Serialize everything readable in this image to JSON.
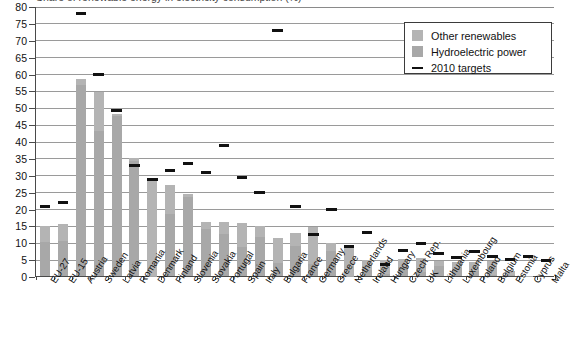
{
  "chart_data": {
    "type": "bar",
    "title": "Share of renewable energy in electricity consumption (%)",
    "xlabel": "",
    "ylabel": "",
    "ylim": [
      0,
      80
    ],
    "ytick_step": 5,
    "yticks": [
      "80",
      "75",
      "70",
      "65",
      "60",
      "55",
      "50",
      "45",
      "40",
      "35",
      "30",
      "25",
      "20",
      "15",
      "10",
      "5",
      "0"
    ],
    "grid": true,
    "legend_position": "top-right",
    "legend": [
      {
        "label": "Other renewables",
        "type": "swatch",
        "color": "#b4b4b4"
      },
      {
        "label": "Hydroelectric power",
        "type": "swatch",
        "color": "#a8a8a8"
      },
      {
        "label": "2010 targets",
        "type": "line",
        "color": "#111111"
      }
    ],
    "categories": [
      "EU-27",
      "EU-15",
      "Austria",
      "Sweden",
      "Latvia",
      "Romania",
      "Denmark",
      "Finland",
      "Slovenia",
      "Slovakia",
      "Portugal",
      "Spain",
      "Italy",
      "Bulgaria",
      "France",
      "Germany",
      "Greece",
      "Netherlands",
      "Ireland",
      "Hungary",
      "Czech Rep.",
      "UK",
      "Lithuania",
      "Luxembourg",
      "Poland",
      "Belgium",
      "Estonia",
      "Cyprus",
      "Malta"
    ],
    "series": [
      {
        "name": "Hydroelectric power",
        "values": [
          10.0,
          10.5,
          56.5,
          43.0,
          47.5,
          34.0,
          0.1,
          18.5,
          23.5,
          14.0,
          12.5,
          8.5,
          11.5,
          4.0,
          9.0,
          3.5,
          7.5,
          0.1,
          1.8,
          0.6,
          2.8,
          1.2,
          3.0,
          2.5,
          1.4,
          0.4,
          0.3,
          0.0,
          0.0
        ]
      },
      {
        "name": "Other renewables",
        "values": [
          4.9,
          4.8,
          1.8,
          11.5,
          0.6,
          0.9,
          29.0,
          8.4,
          0.7,
          2.1,
          3.6,
          7.3,
          3.3,
          7.4,
          3.6,
          11.0,
          2.4,
          8.8,
          3.0,
          4.0,
          2.1,
          4.0,
          1.5,
          1.8,
          2.8,
          4.0,
          1.3,
          0.1,
          0.0
        ]
      }
    ],
    "totals": [
      14.9,
      15.3,
      58.3,
      54.5,
      48.1,
      34.9,
      29.1,
      26.9,
      24.2,
      16.1,
      16.1,
      15.8,
      14.8,
      11.4,
      12.6,
      14.5,
      9.9,
      8.9,
      4.8,
      4.6,
      4.9,
      5.2,
      4.5,
      4.3,
      4.2,
      4.4,
      1.6,
      0.1,
      0.0
    ],
    "targets": [
      21.0,
      22.0,
      78.1,
      60.0,
      49.3,
      33.0,
      29.0,
      31.5,
      33.6,
      31.0,
      39.0,
      29.4,
      25.0,
      11.0,
      21.0,
      12.5,
      20.1,
      9.0,
      13.2,
      3.6,
      8.0,
      10.0,
      7.0,
      5.7,
      7.5,
      6.0,
      5.1,
      6.0,
      5.0
    ],
    "targets_note": "Bulgaria target shown at 73.0; Latvia target 49.3",
    "target_overrides": {
      "Bulgaria": 73.0
    }
  }
}
